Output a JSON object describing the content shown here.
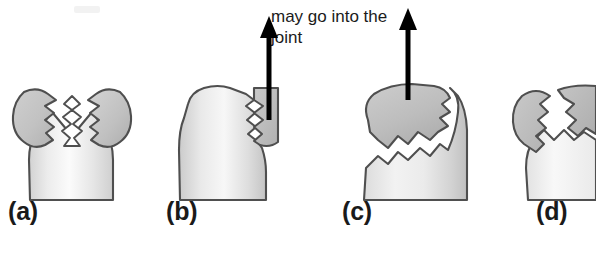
{
  "figure": {
    "background_color": "#ffffff",
    "width": 596,
    "height": 253
  },
  "caption": {
    "text": "may go into the\njoint",
    "line1": "may go into the",
    "line2": "joint",
    "color": "#1b1b1b"
  },
  "colors": {
    "outline": "#4a4a4a",
    "bone_head_fill_dark": "#b9b9b9",
    "bone_head_fill_light": "#d8d8d8",
    "bone_shaft_fill_light": "#f4f4f4",
    "bone_shaft_fill_mid": "#d9d9d9",
    "fracture_gap": "#ffffff",
    "arrow": "#000000",
    "label_text": "#1a1a1a"
  },
  "panels": [
    {
      "id": "a",
      "label": "(a)",
      "label_x": 8,
      "label_y": 199,
      "description": "Bone head split by a V-shaped zigzag fracture into two separated fragments",
      "has_arrow": false,
      "arrow_direction": ""
    },
    {
      "id": "b",
      "label": "(b)",
      "label_x": 166,
      "label_y": 199,
      "description": "Small displaced fragment on the right side of the bone head with upward displacement arrow",
      "has_arrow": true,
      "arrow_direction": "up"
    },
    {
      "id": "c",
      "label": "(c)",
      "label_x": 342,
      "label_y": 199,
      "description": "Large head fragment separated by a diagonal zigzag fracture with upward displacement arrow",
      "has_arrow": true,
      "arrow_direction": "up"
    },
    {
      "id": "d",
      "label": "(d)",
      "label_x": 536,
      "label_y": 199,
      "description": "Comminuted head fracture, illustration cropped at the right edge",
      "has_arrow": false,
      "arrow_direction": ""
    }
  ]
}
